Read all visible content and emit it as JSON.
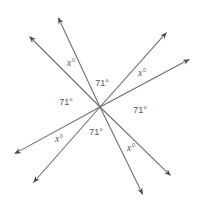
{
  "diagram": {
    "center": [
      100,
      107
    ],
    "line_color": "#6e6e6e",
    "arrow_color": "#4a4a4a",
    "label_color": "#555555",
    "rays": [
      {
        "name": "ray-upper-left",
        "tip": [
          29,
          36
        ]
      },
      {
        "name": "ray-upper",
        "tip": [
          58,
          17
        ]
      },
      {
        "name": "ray-upper-right",
        "tip": [
          167,
          32
        ]
      },
      {
        "name": "ray-right",
        "tip": [
          190,
          59
        ]
      },
      {
        "name": "ray-lower-left",
        "tip": [
          14,
          154
        ]
      },
      {
        "name": "ray-lower",
        "tip": [
          33,
          183
        ]
      },
      {
        "name": "ray-lower-right",
        "tip": [
          171,
          176
        ]
      },
      {
        "name": "ray-bottom",
        "tip": [
          143,
          195
        ]
      }
    ],
    "labels": [
      {
        "name": "angle-label-upper-x",
        "text": "x°",
        "pos": [
          71,
          64
        ],
        "variable": true
      },
      {
        "name": "angle-label-top-71",
        "text": "71°",
        "pos": [
          102,
          84
        ],
        "variable": false
      },
      {
        "name": "angle-label-upper-right-x",
        "text": "x°",
        "pos": [
          142,
          74
        ],
        "variable": true
      },
      {
        "name": "angle-label-left-71",
        "text": "71°",
        "pos": [
          66,
          103
        ],
        "variable": false
      },
      {
        "name": "angle-label-right-71",
        "text": "71°",
        "pos": [
          140,
          111
        ],
        "variable": false
      },
      {
        "name": "angle-label-lower-left-x",
        "text": "x°",
        "pos": [
          59,
          140
        ],
        "variable": true
      },
      {
        "name": "angle-label-bottom-71",
        "text": "71°",
        "pos": [
          96,
          133
        ],
        "variable": false
      },
      {
        "name": "angle-label-lower-right-x",
        "text": "x°",
        "pos": [
          131,
          149
        ],
        "variable": true
      }
    ]
  }
}
